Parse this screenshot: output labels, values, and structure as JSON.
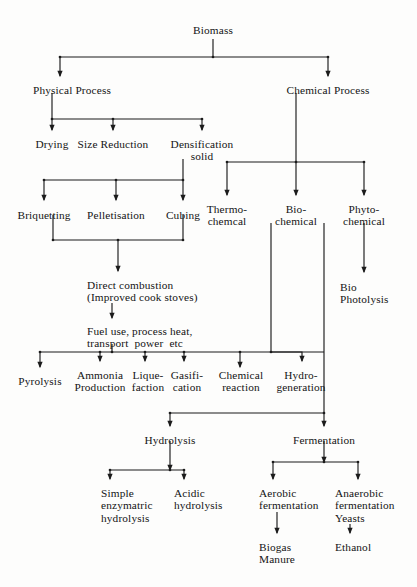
{
  "diagram": {
    "type": "flowchart",
    "width": 417,
    "height": 587,
    "background_color": "#fdfdfc",
    "line_color": "#1b1b1b",
    "text_color": "#141414"
  },
  "nodes": [
    {
      "id": "biomass",
      "label": "Biomass",
      "x": 213,
      "y": 24,
      "align": "ctr"
    },
    {
      "id": "physical",
      "label": "Physical Process",
      "x": 72,
      "y": 84,
      "align": "ctr"
    },
    {
      "id": "chemical",
      "label": "Chemical Process",
      "x": 328,
      "y": 84,
      "align": "ctr"
    },
    {
      "id": "drying",
      "label": "Drying",
      "x": 52,
      "y": 138,
      "align": "ctr"
    },
    {
      "id": "size-reduction",
      "label": "Size Reduction",
      "x": 113,
      "y": 138,
      "align": "ctr"
    },
    {
      "id": "densification",
      "label": "Densification\nsolid",
      "x": 202,
      "y": 138,
      "align": "ctr"
    },
    {
      "id": "briquetting",
      "label": "Briquetting",
      "x": 44,
      "y": 209,
      "align": "ctr"
    },
    {
      "id": "pelletisation",
      "label": "Pelletisation",
      "x": 116,
      "y": 209,
      "align": "ctr"
    },
    {
      "id": "cubing",
      "label": "Cubing",
      "x": 183,
      "y": 209,
      "align": "ctr"
    },
    {
      "id": "thermochemical",
      "label": "Thermo-\nchemcal",
      "x": 227,
      "y": 203,
      "align": "ctr"
    },
    {
      "id": "biochemical",
      "label": "Bio-\nchemical",
      "x": 296,
      "y": 203,
      "align": "ctr"
    },
    {
      "id": "phytochemical",
      "label": "Phyto-\nchemical",
      "x": 364,
      "y": 203,
      "align": "ctr"
    },
    {
      "id": "biophotolysis",
      "label": "Bio\nPhotolysis",
      "x": 340,
      "y": 281,
      "align": "lft"
    },
    {
      "id": "direct-comb",
      "label": "Direct combustion\n(Improved cook stoves)",
      "x": 87,
      "y": 279,
      "align": "lft"
    },
    {
      "id": "fuel-use",
      "label": "Fuel use, process heat,\ntransport  power  etc",
      "x": 87,
      "y": 325,
      "align": "lft"
    },
    {
      "id": "pyrolysis",
      "label": "Pyrolysis",
      "x": 40,
      "y": 375,
      "align": "ctr"
    },
    {
      "id": "ammonia",
      "label": "Ammonia\nProduction",
      "x": 100,
      "y": 369,
      "align": "ctr"
    },
    {
      "id": "liquefaction",
      "label": "Lique-\nfaction",
      "x": 148,
      "y": 369,
      "align": "ctr"
    },
    {
      "id": "gasification",
      "label": "Gasifi-\ncation",
      "x": 187,
      "y": 369,
      "align": "ctr"
    },
    {
      "id": "chem-reaction",
      "label": "Chemical\nreaction",
      "x": 241,
      "y": 369,
      "align": "ctr"
    },
    {
      "id": "hydrogeneration",
      "label": "Hydro-\ngeneration",
      "x": 301,
      "y": 369,
      "align": "ctr"
    },
    {
      "id": "hydrolysis",
      "label": "Hydrolysis",
      "x": 170,
      "y": 434,
      "align": "ctr"
    },
    {
      "id": "fermentation",
      "label": "Fermentation",
      "x": 324,
      "y": 434,
      "align": "ctr"
    },
    {
      "id": "simple-enzym",
      "label": "Simple\nenzymatric\nhydrolysis",
      "x": 101,
      "y": 487,
      "align": "lft"
    },
    {
      "id": "acidic-hydro",
      "label": "Acidic\nhydrolysis",
      "x": 174,
      "y": 487,
      "align": "lft"
    },
    {
      "id": "aerobic",
      "label": "Aerobic\nfermentation",
      "x": 259,
      "y": 487,
      "align": "lft"
    },
    {
      "id": "anaerobic",
      "label": "Anaerobic\nfermentation\nYeasts",
      "x": 335,
      "y": 487,
      "align": "lft"
    },
    {
      "id": "biogas",
      "label": "Biogas\nManure",
      "x": 259,
      "y": 541,
      "align": "lft"
    },
    {
      "id": "ethanol",
      "label": "Ethanol",
      "x": 335,
      "y": 541,
      "align": "lft"
    }
  ],
  "edges": [
    {
      "id": "e-biomass-stem",
      "from": "biomass",
      "to": "split-1",
      "path": "M213,39 L213,57"
    },
    {
      "id": "e-split1-bar",
      "from": "split-1",
      "to": "split-1",
      "path": "M60,57 L328,57"
    },
    {
      "id": "e-to-physical",
      "from": "split-1",
      "to": "physical",
      "path": "M60,57 L60,76",
      "arrow": "down"
    },
    {
      "id": "e-to-chemical",
      "from": "split-1",
      "to": "chemical",
      "path": "M328,57 L328,76",
      "arrow": "down"
    },
    {
      "id": "e-physical-stem",
      "from": "physical",
      "to": "split-2",
      "path": "M52,93 L52,119"
    },
    {
      "id": "e-split2-bar",
      "from": "split-2",
      "to": "split-2",
      "path": "M52,119 L202,119"
    },
    {
      "id": "e-to-drying",
      "from": "split-2",
      "to": "drying",
      "path": "M52,119 L52,130",
      "arrow": "down"
    },
    {
      "id": "e-to-size-reduction",
      "from": "split-2",
      "to": "size-reduction",
      "path": "M113,119 L113,130",
      "arrow": "down"
    },
    {
      "id": "e-to-densification",
      "from": "split-2",
      "to": "densification",
      "path": "M202,119 L202,130",
      "arrow": "down"
    },
    {
      "id": "e-densif-stem",
      "from": "densification",
      "to": "split-3",
      "path": "M183,159 L183,180"
    },
    {
      "id": "e-split3-bar",
      "from": "split-3",
      "to": "split-3",
      "path": "M44,180 L183,180"
    },
    {
      "id": "e-to-briquetting",
      "from": "split-3",
      "to": "briquetting",
      "path": "M44,180 L44,200",
      "arrow": "down"
    },
    {
      "id": "e-to-pelletisation",
      "from": "split-3",
      "to": "pelletisation",
      "path": "M116,180 L116,200",
      "arrow": "down"
    },
    {
      "id": "e-to-cubing",
      "from": "split-3",
      "to": "cubing",
      "path": "M183,180 L183,200",
      "arrow": "down"
    },
    {
      "id": "e-briq-down",
      "from": "briquetting",
      "to": "merge-1",
      "path": "M53,215 L53,240"
    },
    {
      "id": "e-cubing-down",
      "from": "cubing",
      "to": "merge-1",
      "path": "M183,215 L183,240"
    },
    {
      "id": "e-merge1-bar",
      "from": "merge-1",
      "to": "merge-1",
      "path": "M53,240 L183,240"
    },
    {
      "id": "e-merge1-stem",
      "from": "merge-1",
      "to": "direct-comb",
      "path": "M118,240 L118,271",
      "arrow": "down"
    },
    {
      "id": "e-comb-to-fuel",
      "from": "direct-comb",
      "to": "fuel-use",
      "path": "M112,303 L112,318",
      "arrow": "down"
    },
    {
      "id": "e-fuel-stem",
      "from": "fuel-use",
      "to": "split-5",
      "path": "M112,344 L112,352"
    },
    {
      "id": "e-split5-bar",
      "from": "split-5",
      "to": "split-5",
      "path": "M40,352 L324,352"
    },
    {
      "id": "e-to-pyrolysis",
      "from": "split-5",
      "to": "pyrolysis",
      "path": "M40,352 L40,367",
      "arrow": "down"
    },
    {
      "id": "e-to-ammonia",
      "from": "split-5",
      "to": "ammonia",
      "path": "M100,352 L100,361",
      "arrow": "down"
    },
    {
      "id": "e-to-liquefaction",
      "from": "split-5",
      "to": "liquefaction",
      "path": "M145,352 L145,361",
      "arrow": "down"
    },
    {
      "id": "e-to-gasification",
      "from": "split-5",
      "to": "gasification",
      "path": "M184,352 L184,361",
      "arrow": "down"
    },
    {
      "id": "e-to-chem-reaction",
      "from": "split-5",
      "to": "chem-reaction",
      "path": "M240,352 L240,367",
      "arrow": "down"
    },
    {
      "id": "e-chem-stem",
      "from": "chemical",
      "to": "split-4",
      "path": "M296,93 L296,162"
    },
    {
      "id": "e-split4-bar",
      "from": "split-4",
      "to": "split-4",
      "path": "M227,162 L364,162"
    },
    {
      "id": "e-to-thermochemical",
      "from": "split-4",
      "to": "thermochemical",
      "path": "M227,162 L227,195",
      "arrow": "down"
    },
    {
      "id": "e-to-biochemical",
      "from": "split-4",
      "to": "biochemical",
      "path": "M296,162 L296,195",
      "arrow": "down"
    },
    {
      "id": "e-to-phytochemical",
      "from": "split-4",
      "to": "phytochemical",
      "path": "M364,162 L364,195",
      "arrow": "down"
    },
    {
      "id": "e-phyto-to-biophot",
      "from": "phytochemical",
      "to": "biophotolysis",
      "path": "M364,223 L364,272",
      "arrow": "down"
    },
    {
      "id": "e-biochem-down",
      "from": "biochemical",
      "to": "hydrogeneration",
      "path": "M271,223 L271,352"
    },
    {
      "id": "e-hydrogen-elbow",
      "from": "split-5",
      "to": "hydrogeneration",
      "path": "M271,352 L302,352 L302,361",
      "arrow": "down"
    },
    {
      "id": "e-biochem-right-down",
      "from": "biochemical",
      "to": "split-6",
      "path": "M324,223 L324,413"
    },
    {
      "id": "e-split6-bar",
      "from": "split-6",
      "to": "split-6",
      "path": "M170,413 L324,413"
    },
    {
      "id": "e-to-hydrolysis",
      "from": "split-6",
      "to": "hydrolysis",
      "path": "M170,413 L170,426",
      "arrow": "down"
    },
    {
      "id": "e-to-fermentation",
      "from": "split-6",
      "to": "fermentation",
      "path": "M324,413 L324,426",
      "arrow": "down"
    },
    {
      "id": "e-hydrolysis-stem",
      "from": "hydrolysis",
      "to": "split-7",
      "path": "M170,441 L170,470",
      "arrow": "down"
    },
    {
      "id": "e-split7-bar",
      "from": "split-7",
      "to": "split-7",
      "path": "M110,470 L184,470"
    },
    {
      "id": "e-to-simple-enzym",
      "from": "split-7",
      "to": "simple-enzym",
      "path": "M110,470 L110,479",
      "arrow": "down"
    },
    {
      "id": "e-to-acidic-hydro",
      "from": "split-7",
      "to": "acidic-hydro",
      "path": "M184,470 L184,479",
      "arrow": "down"
    },
    {
      "id": "e-ferment-stem",
      "from": "fermentation",
      "to": "split-8",
      "path": "M324,441 L324,462",
      "arrow": "down"
    },
    {
      "id": "e-split8-bar",
      "from": "split-8",
      "to": "split-8",
      "path": "M273,462 L358,462"
    },
    {
      "id": "e-to-aerobic",
      "from": "split-8",
      "to": "aerobic",
      "path": "M273,462 L273,479",
      "arrow": "down"
    },
    {
      "id": "e-to-anaerobic",
      "from": "split-8",
      "to": "anaerobic",
      "path": "M358,462 L358,479",
      "arrow": "down"
    },
    {
      "id": "e-aerobic-to-biogas",
      "from": "aerobic",
      "to": "biogas",
      "path": "M277,512 L277,533",
      "arrow": "down"
    },
    {
      "id": "e-anaerobic-to-ethanol",
      "from": "anaerobic",
      "to": "ethanol",
      "path": "M350,524 L350,533",
      "arrow": "down"
    }
  ]
}
